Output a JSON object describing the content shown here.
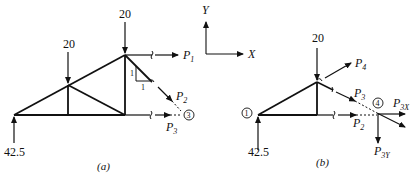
{
  "figure_a": {
    "caption": "(a)",
    "loads": {
      "left_top": "20",
      "mid_top": "20",
      "reaction": "42.5"
    },
    "member_forces": [
      {
        "name": "P",
        "sub": "1"
      },
      {
        "name": "P",
        "sub": "2"
      },
      {
        "name": "P",
        "sub": "3"
      }
    ],
    "slope_labels": {
      "vertical": "1",
      "horizontal": "1"
    },
    "joint_label": "3"
  },
  "figure_b": {
    "caption": "(b)",
    "loads": {
      "top": "20",
      "reaction": "42.5"
    },
    "member_forces": [
      {
        "name": "P",
        "sub": "4"
      },
      {
        "name": "P",
        "sub": "3"
      },
      {
        "name": "P",
        "sub": "2"
      },
      {
        "name": "P",
        "sub": "3X"
      },
      {
        "name": "P",
        "sub": "3Y"
      }
    ],
    "joint_labels": {
      "left": "1",
      "right": "4"
    }
  },
  "axes": {
    "x_label": "X",
    "y_label": "Y"
  }
}
